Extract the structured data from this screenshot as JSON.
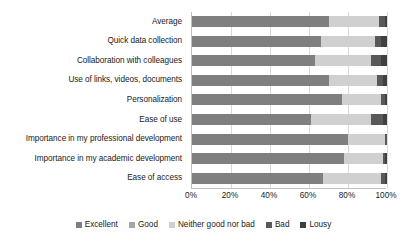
{
  "chart_data": {
    "type": "bar",
    "orientation": "horizontal",
    "stacked": true,
    "normalized": "percent",
    "title": "",
    "xlabel": "",
    "ylabel": "",
    "xlim": [
      0,
      100
    ],
    "grid": true,
    "legend_position": "bottom",
    "xticks": [
      "0%",
      "20%",
      "40%",
      "60%",
      "80%",
      "100%"
    ],
    "xtick_values": [
      0,
      20,
      40,
      60,
      80,
      100
    ],
    "categories": [
      "Average",
      "Quick data collection",
      "Collaboration with colleagues",
      "Use of links, videos, documents",
      "Personalization",
      "Ease of use",
      "Importance in my professional development",
      "Importance in my academic development",
      "Ease of access"
    ],
    "series": [
      {
        "name": "Excellent",
        "color": "#7f7f7f",
        "values": [
          70,
          66,
          63,
          70,
          77,
          61,
          80,
          78,
          67
        ]
      },
      {
        "name": "Good",
        "color": "#a6a6a6",
        "values": [
          0,
          0,
          0,
          0,
          0,
          0,
          0,
          0,
          0
        ]
      },
      {
        "name": "Neither good nor bad",
        "color": "#d0d0d0",
        "values": [
          26,
          28,
          29,
          25,
          20,
          31,
          19,
          20,
          30
        ]
      },
      {
        "name": "Bad",
        "color": "#595959",
        "values": [
          3,
          3,
          5,
          3,
          2,
          6,
          1,
          1,
          2
        ]
      },
      {
        "name": "Lousy",
        "color": "#404040",
        "values": [
          1,
          3,
          3,
          2,
          1,
          2,
          0,
          1,
          1
        ]
      }
    ]
  },
  "legend": {
    "items": [
      {
        "label": "Excellent",
        "color": "#7f7f7f"
      },
      {
        "label": "Good",
        "color": "#a6a6a6"
      },
      {
        "label": "Neither good nor bad",
        "color": "#d0d0d0"
      },
      {
        "label": "Bad",
        "color": "#595959"
      },
      {
        "label": "Lousy",
        "color": "#404040"
      }
    ]
  },
  "colors": {
    "gridline": "#d9d9d9",
    "axis": "#bfbfbf",
    "text": "#1a1a1a",
    "background": "#ffffff"
  }
}
